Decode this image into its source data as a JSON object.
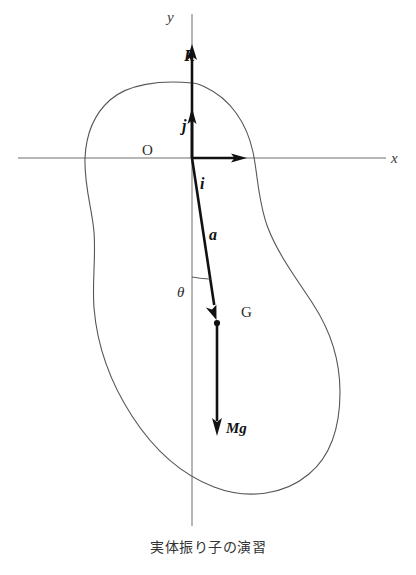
{
  "figure": {
    "caption": "実体振り子の演習",
    "axes": {
      "x_label": "x",
      "y_label": "y"
    },
    "points": {
      "origin_label": "O",
      "center_of_mass_label": "G"
    },
    "vectors": {
      "reaction_label": "R",
      "unit_j_label": "j",
      "unit_i_label": "i",
      "position_a_label": "a",
      "weight_label": "Mg"
    },
    "angle": {
      "label": "θ"
    },
    "colors": {
      "axis": "#6e6e6e",
      "outline": "#555555",
      "vector": "#111111",
      "background": "#ffffff"
    }
  },
  "geometry": {
    "origin": {
      "x": 192,
      "y": 158
    },
    "center_of_mass": {
      "x": 217,
      "y": 323
    },
    "reaction_tip": {
      "y": 45
    },
    "weight_tip": {
      "y": 434
    },
    "theta_degrees": 9
  }
}
